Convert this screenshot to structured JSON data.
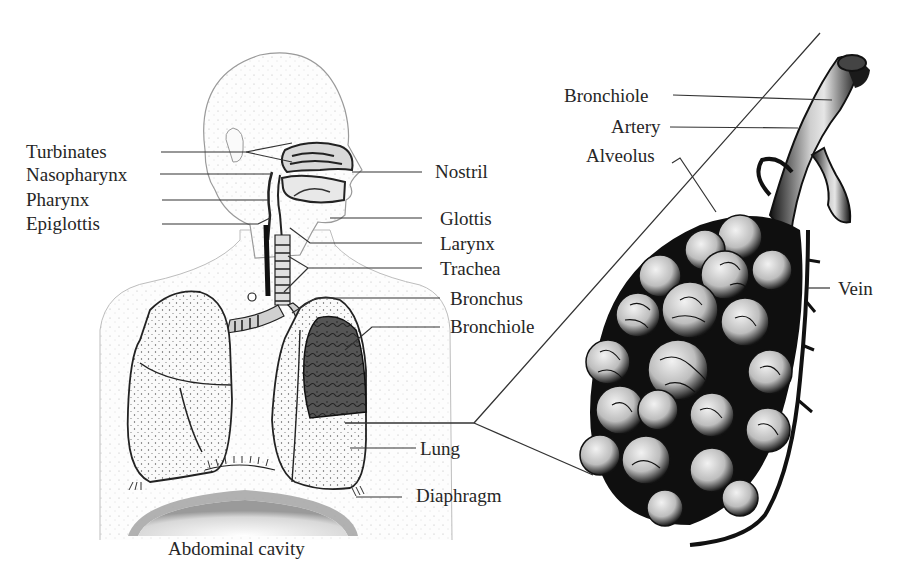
{
  "figure": {
    "topic": "Human respiratory system with enlarged view of alveoli",
    "left_panel": {
      "labels_left": [
        {
          "text": "Turbinates"
        },
        {
          "text": "Nasopharynx"
        },
        {
          "text": "Pharynx"
        },
        {
          "text": "Epiglottis"
        }
      ],
      "labels_right": [
        {
          "text": "Nostril"
        },
        {
          "text": "Glottis"
        },
        {
          "text": "Larynx"
        },
        {
          "text": "Trachea"
        },
        {
          "text": "Bronchus"
        },
        {
          "text": "Bronchiole"
        },
        {
          "text": "Lung"
        },
        {
          "text": "Diaphragm"
        }
      ],
      "bottom_label": {
        "text": "Abdominal cavity"
      }
    },
    "right_panel": {
      "labels": [
        {
          "text": "Bronchiole"
        },
        {
          "text": "Artery"
        },
        {
          "text": "Alveolus"
        },
        {
          "text": "Vein"
        }
      ]
    },
    "colors": {
      "ink": "#262626",
      "background": "#ffffff",
      "stipple": "#8a8a8a",
      "dark_tissue": "#111111"
    }
  }
}
